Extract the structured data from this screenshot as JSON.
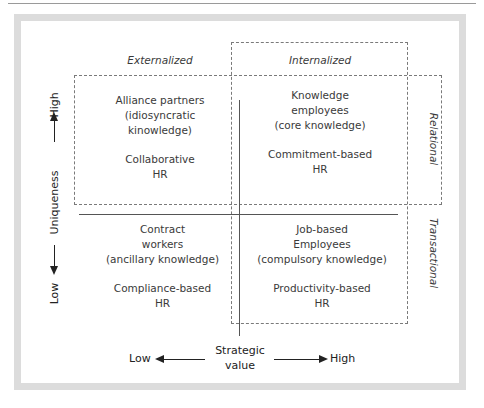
{
  "diagram": {
    "column_headers": {
      "externalized": "Externalized",
      "internalized": "Internalized"
    },
    "row_headers": {
      "relational": "Relational",
      "transactional": "Transactional"
    },
    "quadrants": [
      {
        "position": "top-left",
        "title_lines": [
          "Alliance partners",
          "(idiosyncratic",
          "kinowledge)"
        ],
        "hr_lines": [
          "Collaborative",
          "HR"
        ]
      },
      {
        "position": "top-right",
        "title_lines": [
          "Knowledge",
          "employees",
          "(core knowledge)"
        ],
        "hr_lines": [
          "Commitment-based",
          "HR"
        ]
      },
      {
        "position": "bottom-left",
        "title_lines": [
          "Contract",
          "workers",
          "(ancillary knowledge)"
        ],
        "hr_lines": [
          "Compliance-based",
          "HR"
        ]
      },
      {
        "position": "bottom-right",
        "title_lines": [
          "Job-based",
          "Employees",
          "(compulsory knowledge)"
        ],
        "hr_lines": [
          "Productivity-based",
          "HR"
        ]
      }
    ],
    "y_axis": {
      "label": "Uniqueness",
      "high": "High",
      "low": "Low"
    },
    "x_axis": {
      "label_line1": "Strategic",
      "label_line2": "value",
      "low": "Low",
      "high": "High"
    }
  }
}
